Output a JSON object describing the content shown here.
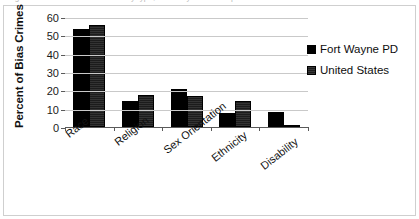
{
  "caption_sliver": "Figure 3.  Percent of bias crimes by type, Fort Wayne PD compared to United States",
  "chart_data": {
    "type": "bar",
    "title": "",
    "xlabel": "",
    "ylabel": "Percent of Bias Crimes",
    "categories": [
      "Race",
      "Religion",
      "Sex Orientation",
      "Ethnicity",
      "Disability"
    ],
    "series": [
      {
        "name": "Fort Wayne PD",
        "color": "#000000",
        "values": [
          53.5,
          14,
          21,
          7.5,
          8
        ]
      },
      {
        "name": "United States",
        "color": "#1c1c1c",
        "values": [
          55.5,
          17.5,
          17,
          14,
          1
        ]
      }
    ],
    "ylim": [
      0,
      60
    ],
    "yticks": [
      60,
      50,
      40,
      30,
      20,
      10,
      0
    ],
    "grid": true,
    "legend_position": "right"
  },
  "legend": {
    "items": [
      {
        "label": "Fort Wayne PD"
      },
      {
        "label": "United States"
      }
    ]
  }
}
